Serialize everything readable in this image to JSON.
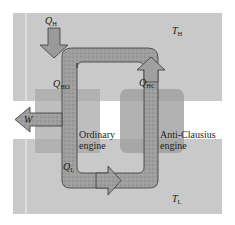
{
  "diagram": {
    "reservoirs": {
      "hot": {
        "symbol": "T",
        "subscript": "H",
        "color": "#c9c9c9"
      },
      "cold": {
        "symbol": "T",
        "subscript": "L",
        "color": "#c9c9c9"
      }
    },
    "engines": [
      {
        "id": "ordinary",
        "label_line1": "Ordinary",
        "label_line2": "engine",
        "color": "#a9a9a9"
      },
      {
        "id": "anti-clausius",
        "label_line1": "Anti-Clausius",
        "label_line2": "engine",
        "color": "#a2a2a2"
      }
    ],
    "flows": {
      "q_h": {
        "symbol": "Q",
        "subscript": "H"
      },
      "q_ho": {
        "symbol": "Q",
        "subscript": "HO"
      },
      "q_hc": {
        "symbol": "Q",
        "subscript": "HC"
      },
      "q_l": {
        "symbol": "Q",
        "subscript": "L"
      },
      "w": {
        "symbol": "W"
      }
    },
    "colors": {
      "background": "#ffffff",
      "tube_fill": "#9c9c9c",
      "tube_stroke": "#3a3a3a",
      "text": "#1a1a1a"
    }
  }
}
